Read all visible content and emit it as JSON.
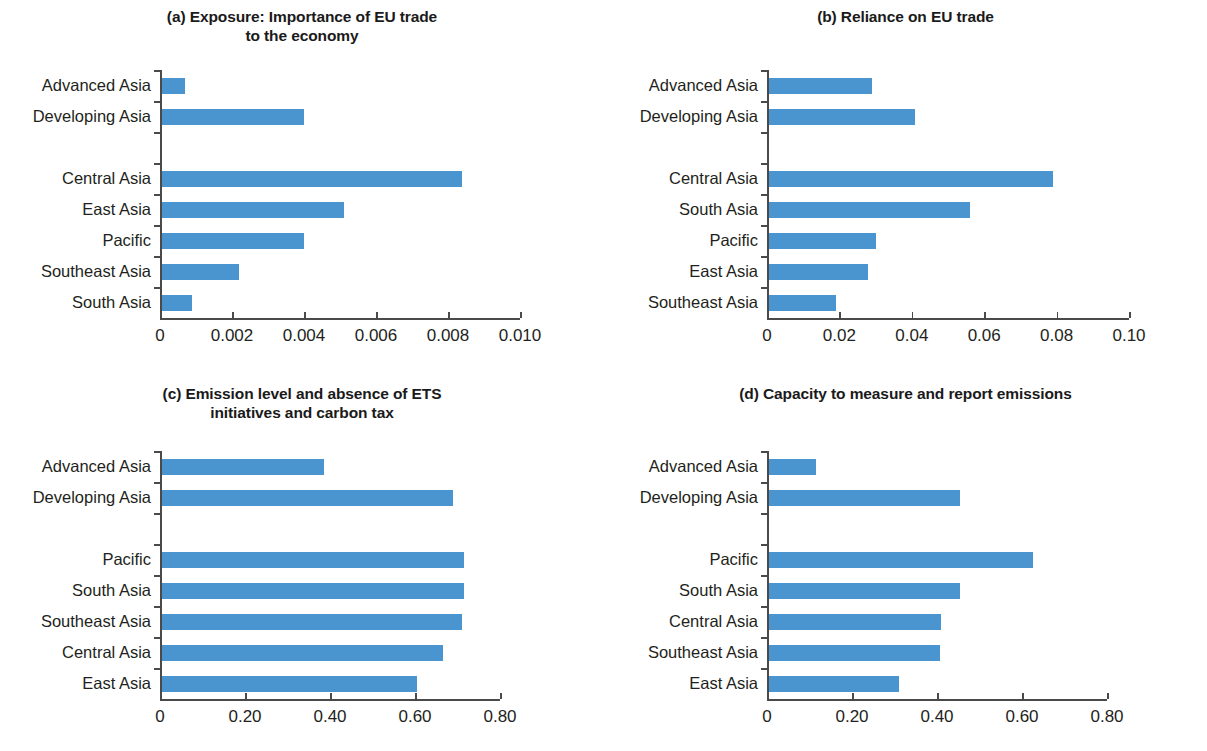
{
  "figure": {
    "panels": [
      {
        "key": "a",
        "title": "(a) Exposure: Importance of EU trade\nto the economy"
      },
      {
        "key": "b",
        "title": "(b) Reliance on EU trade"
      },
      {
        "key": "c",
        "title": "(c) Emission level and absence of ETS\ninitiatives and carbon tax"
      },
      {
        "key": "d",
        "title": "(d) Capacity to measure and report emissions"
      }
    ],
    "bar_color": "#4a95cf",
    "axis_color": "#4a4a4a"
  },
  "chart_data": [
    {
      "type": "bar",
      "orientation": "horizontal",
      "panel": "a",
      "title": "(a) Exposure: Importance of EU trade to the economy",
      "xlabel": "",
      "ylabel": "",
      "xlim": [
        0,
        0.01
      ],
      "xticks": [
        0,
        0.002,
        0.004,
        0.006,
        0.008,
        0.01
      ],
      "xtick_labels": [
        "0",
        "0.002",
        "0.004",
        "0.006",
        "0.008",
        "0.010"
      ],
      "grid": false,
      "legend": "none",
      "group_gap_after_index": 1,
      "categories": [
        "Advanced Asia",
        "Developing Asia",
        "Central Asia",
        "East Asia",
        "Pacific",
        "Southeast Asia",
        "South Asia"
      ],
      "values": [
        0.0007,
        0.004,
        0.0084,
        0.0051,
        0.004,
        0.0022,
        0.0009
      ]
    },
    {
      "type": "bar",
      "orientation": "horizontal",
      "panel": "b",
      "title": "(b) Reliance on EU trade",
      "xlabel": "",
      "ylabel": "",
      "xlim": [
        0,
        0.1
      ],
      "xticks": [
        0,
        0.02,
        0.04,
        0.06,
        0.08,
        0.1
      ],
      "xtick_labels": [
        "0",
        "0.02",
        "0.04",
        "0.06",
        "0.08",
        "0.10"
      ],
      "grid": false,
      "legend": "none",
      "group_gap_after_index": 1,
      "categories": [
        "Advanced Asia",
        "Developing Asia",
        "Central Asia",
        "South Asia",
        "Pacific",
        "East Asia",
        "Southeast Asia"
      ],
      "values": [
        0.029,
        0.041,
        0.079,
        0.056,
        0.03,
        0.028,
        0.019
      ]
    },
    {
      "type": "bar",
      "orientation": "horizontal",
      "panel": "c",
      "title": "(c) Emission level and absence of ETS initiatives and carbon tax",
      "xlabel": "",
      "ylabel": "",
      "xlim": [
        0,
        0.8
      ],
      "xticks": [
        0,
        0.2,
        0.4,
        0.6,
        0.8
      ],
      "xtick_labels": [
        "0",
        "0.20",
        "0.40",
        "0.60",
        "0.80"
      ],
      "grid": false,
      "legend": "none",
      "group_gap_after_index": 1,
      "categories": [
        "Advanced Asia",
        "Developing Asia",
        "Pacific",
        "South Asia",
        "Southeast Asia",
        "Central Asia",
        "East Asia"
      ],
      "values": [
        0.385,
        0.69,
        0.715,
        0.715,
        0.71,
        0.665,
        0.605
      ]
    },
    {
      "type": "bar",
      "orientation": "horizontal",
      "panel": "d",
      "title": "(d) Capacity to measure and report emissions",
      "xlabel": "",
      "ylabel": "",
      "xlim": [
        0,
        0.8
      ],
      "xticks": [
        0,
        0.2,
        0.4,
        0.6,
        0.8
      ],
      "xtick_labels": [
        "0",
        "0.20",
        "0.40",
        "0.60",
        "0.80"
      ],
      "grid": false,
      "legend": "none",
      "group_gap_after_index": 1,
      "categories": [
        "Advanced Asia",
        "Developing Asia",
        "Pacific",
        "South Asia",
        "Central Asia",
        "Southeast Asia",
        "East Asia"
      ],
      "values": [
        0.115,
        0.455,
        0.625,
        0.455,
        0.41,
        0.408,
        0.31
      ]
    }
  ]
}
